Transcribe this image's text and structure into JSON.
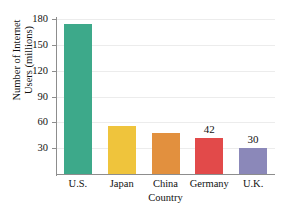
{
  "chart_data": {
    "type": "bar",
    "title": "",
    "title_note": "clipped-at-top-edge-illegible",
    "xlabel": "Country",
    "ylabel": "Number of Internet Users (millions)",
    "ylabel_line1": "Number of Internet",
    "ylabel_line2": "Users (millions)",
    "categories": [
      "U.S.",
      "Japan",
      "China",
      "Germany",
      "U.K."
    ],
    "values": [
      174,
      56,
      48,
      42,
      30
    ],
    "point_labels": [
      "",
      "",
      "",
      "42",
      "30"
    ],
    "colors": [
      "#3DA98A",
      "#EFC43C",
      "#E2903E",
      "#E24A4A",
      "#8B88B9"
    ],
    "ylim": [
      0,
      180
    ],
    "yticks": [
      30,
      60,
      90,
      120,
      150,
      180
    ],
    "ytick_labels": [
      "30",
      "60",
      "90",
      "120",
      "150",
      "180"
    ],
    "grid": true,
    "grid_axis": "y",
    "legend": false,
    "legend_position": "none"
  }
}
